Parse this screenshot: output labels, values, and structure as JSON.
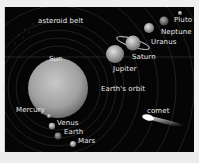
{
  "diagram": {
    "labels": {
      "asteroid_belt": "asteroid belt",
      "sun": "Sun",
      "mercury": "Mercury",
      "venus": "Venus",
      "earth": "Earth",
      "mars": "Mars",
      "jupiter": "Jupiter",
      "saturn": "Saturn",
      "uranus": "Uranus",
      "neptune": "Neptune",
      "pluto": "Pluto",
      "earths_orbit": "Earth's orbit",
      "comet": "comet"
    },
    "colors": {
      "background": "#050505",
      "label": "#e8e8e8",
      "orbit": "#3a3a3a"
    }
  }
}
